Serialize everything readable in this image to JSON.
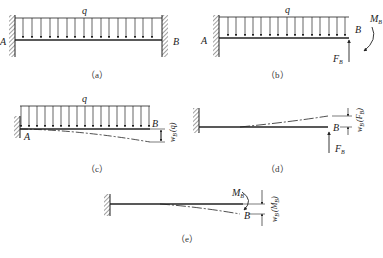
{
  "figure": {
    "panels": [
      {
        "id": "a",
        "caption": "（a）",
        "load_label": "q",
        "left_label": "A",
        "right_label": "B"
      },
      {
        "id": "b",
        "caption": "（b）",
        "load_label": "q",
        "left_label": "A",
        "end_label": "B",
        "force_label": "F",
        "force_sub": "B",
        "moment_label": "M",
        "moment_sub": "B"
      },
      {
        "id": "c",
        "caption": "（c）",
        "load_label": "q",
        "left_label": "A",
        "end_label": "B",
        "deflection_label": "w",
        "deflection_sub": "B",
        "deflection_cause": "(q)"
      },
      {
        "id": "d",
        "caption": "（d）",
        "end_label": "B",
        "force_label": "F",
        "force_sub": "B",
        "deflection_label": "w",
        "deflection_sub": "B",
        "deflection_cause": "(F",
        "deflection_cause_sub": "B",
        "deflection_cause_close": ")"
      },
      {
        "id": "e",
        "caption": "（e）",
        "end_label": "B",
        "moment_label": "M",
        "moment_sub": "B",
        "deflection_label": "w",
        "deflection_sub": "B",
        "deflection_cause": "(M",
        "deflection_cause_sub": "B",
        "deflection_cause_close": ")"
      }
    ]
  }
}
